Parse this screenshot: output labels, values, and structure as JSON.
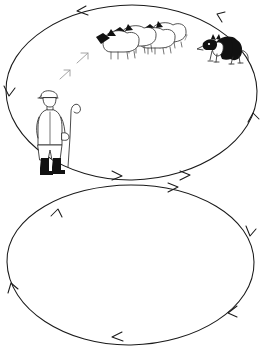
{
  "scene": {
    "title": "Sheepdog herding outrun diagram",
    "width": 268,
    "height": 352,
    "background_color": "#ffffff",
    "ink_color": "#1a1a1a",
    "hint_arrow_color": "#9a9a9a"
  },
  "paths": [
    {
      "id": "upper-loop",
      "name": "upper-flow-loop",
      "shape": "ellipse",
      "direction": "counter-clockwise",
      "center": [
        132,
        92
      ],
      "radius_x": 126,
      "radius_y": 88,
      "arrow_count": 6
    },
    {
      "id": "lower-loop",
      "name": "lower-flow-loop",
      "shape": "ellipse",
      "direction": "clockwise",
      "center": [
        131,
        262
      ],
      "radius_x": 123,
      "radius_y": 78,
      "arrow_count": 6
    }
  ],
  "figures": [
    {
      "id": "shepherd",
      "name": "shepherd",
      "label": "Shepherd with crook",
      "position": [
        58,
        126
      ],
      "facing": "right",
      "parts": [
        "flat-cap",
        "coat",
        "trousers",
        "boots",
        "crook"
      ]
    },
    {
      "id": "flock",
      "name": "sheep-flock",
      "label": "Flock of sheep",
      "position": [
        135,
        42
      ],
      "count": 4,
      "facing": "left",
      "markings": "black face and legs, white fleece"
    },
    {
      "id": "dog",
      "name": "border-collie",
      "label": "Border collie",
      "position": [
        221,
        47
      ],
      "facing": "left",
      "pose": "crouching stalk",
      "markings": "black and white"
    }
  ],
  "hint_arrows": [
    {
      "name": "movement-hint-1",
      "position": [
        64,
        74
      ],
      "angle_deg": -40
    },
    {
      "name": "movement-hint-2",
      "position": [
        81,
        58
      ],
      "angle_deg": -40
    },
    {
      "name": "movement-hint-3",
      "position": [
        180,
        38
      ],
      "angle_deg": -20
    }
  ]
}
